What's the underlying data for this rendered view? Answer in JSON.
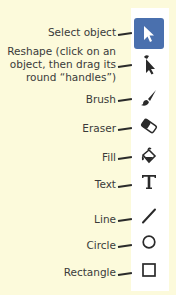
{
  "colors": {
    "background": "#fcfadb",
    "panel": "#ffffff",
    "active_tool": "#4a70ae",
    "icon": "#2a2a2a",
    "label_text": "#3a3a3a"
  },
  "tools": [
    {
      "id": "select",
      "label": "Select object",
      "icon": "arrow-cursor-icon",
      "active": true
    },
    {
      "id": "reshape",
      "label_lines": [
        "Reshape (click on an",
        "object, then drag its",
        "round “handles”)"
      ],
      "icon": "reshape-cursor-icon",
      "active": false
    },
    {
      "id": "brush",
      "label": "Brush",
      "icon": "brush-icon",
      "active": false
    },
    {
      "id": "eraser",
      "label": "Eraser",
      "icon": "eraser-icon",
      "active": false
    },
    {
      "id": "fill",
      "label": "Fill",
      "icon": "paint-bucket-icon",
      "active": false
    },
    {
      "id": "text",
      "label": "Text",
      "icon": "text-T-icon",
      "active": false
    },
    {
      "id": "line",
      "label": "Line",
      "icon": "line-icon",
      "active": false
    },
    {
      "id": "circle",
      "label": "Circle",
      "icon": "circle-icon",
      "active": false
    },
    {
      "id": "rectangle",
      "label": "Rectangle",
      "icon": "rectangle-icon",
      "active": false
    }
  ]
}
